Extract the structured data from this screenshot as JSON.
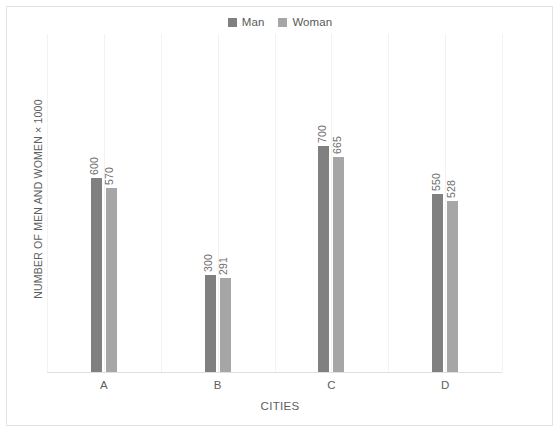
{
  "chart_data": {
    "type": "bar",
    "title": "",
    "categories": [
      "A",
      "B",
      "C",
      "D"
    ],
    "series": [
      {
        "name": "Man",
        "color": "#808080",
        "values": [
          600,
          570,
          700,
          550
        ]
      },
      {
        "name": "Woman",
        "color": "#a6a6a6",
        "values": [
          570,
          291,
          665,
          528
        ]
      }
    ],
    "series_resolved": [
      {
        "name": "Man",
        "color": "#808080",
        "values": [
          600,
          300,
          700,
          550
        ]
      },
      {
        "name": "Woman",
        "color": "#a6a6a6",
        "values": [
          570,
          291,
          665,
          528
        ]
      }
    ],
    "xlabel": "CITIES",
    "ylabel": "NUMBER OF MEN AND WOMEN × 1000",
    "ylim": [
      0,
      1046
    ],
    "grid": "vertical",
    "y_tick_labels": [],
    "legend_position": "top-center",
    "data_labels": true,
    "data_label_rotation": -90,
    "background": "#ffffff",
    "border_color": "#e3e3e3",
    "gridline_color": "#f2f2f2"
  },
  "legend": {
    "entries": [
      {
        "label": "Man",
        "color": "#808080",
        "swatch_name": "legend-swatch-man"
      },
      {
        "label": "Woman",
        "color": "#a6a6a6",
        "swatch_name": "legend-swatch-woman"
      }
    ]
  },
  "axes": {
    "x_title": "CITIES",
    "y_title": "NUMBER OF MEN AND WOMEN × 1000",
    "x_ticks": [
      "A",
      "B",
      "C",
      "D"
    ]
  },
  "bar_labels": {
    "a_man": "600",
    "a_woman": "570",
    "b_man": "300",
    "b_woman": "291",
    "c_man": "700",
    "c_woman": "665",
    "d_man": "550",
    "d_woman": "528"
  }
}
